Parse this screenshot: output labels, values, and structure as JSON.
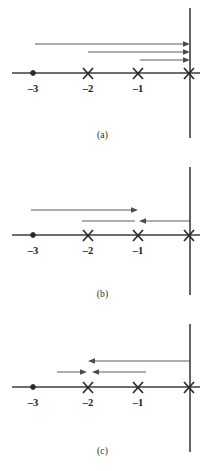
{
  "figure": {
    "title": "",
    "type": "root-locus-real-axis-diagrams",
    "panel_count": 3
  },
  "colors": {
    "axis": "#3d3d3d",
    "locus": "#4a4a4a",
    "text": "#1a1a1a",
    "caption": "#2b2b2b",
    "background": "#ffffff"
  },
  "ticks": {
    "minus_three": "–3",
    "minus_two": "–2",
    "minus_one": "–1"
  },
  "panels": [
    {
      "id": "a",
      "caption": "(a)",
      "marks": [
        {
          "type": "zero",
          "label": "–3",
          "x": -3
        },
        {
          "type": "pole",
          "label": "–2",
          "x": -2
        },
        {
          "type": "pole",
          "label": "–1",
          "x": -1
        },
        {
          "type": "pole",
          "label": "",
          "x": 0
        }
      ],
      "branches": [
        {
          "name": "branch-1",
          "from": -3,
          "to": 0,
          "direction": "right",
          "level": 1
        },
        {
          "name": "branch-2",
          "from": -2,
          "to": 0,
          "direction": "right",
          "level": 2
        },
        {
          "name": "branch-3",
          "from": -1,
          "to": 0,
          "direction": "right",
          "level": 3
        }
      ]
    },
    {
      "id": "b",
      "caption": "(b)",
      "marks": [
        {
          "type": "zero",
          "label": "–3",
          "x": -3
        },
        {
          "type": "pole",
          "label": "–2",
          "x": -2
        },
        {
          "type": "pole",
          "label": "–1",
          "x": -1
        },
        {
          "type": "pole",
          "label": "",
          "x": 0
        }
      ],
      "branches": [
        {
          "name": "branch-1",
          "from": -3,
          "to": -1,
          "direction": "right",
          "level": 1
        },
        {
          "name": "branch-2",
          "from": 0,
          "to": -1,
          "direction": "left",
          "level": 2
        }
      ]
    },
    {
      "id": "c",
      "caption": "(c)",
      "marks": [
        {
          "type": "zero",
          "label": "–3",
          "x": -3
        },
        {
          "type": "pole",
          "label": "–2",
          "x": -2
        },
        {
          "type": "pole",
          "label": "–1",
          "x": -1
        },
        {
          "type": "pole",
          "label": "",
          "x": 0
        }
      ],
      "branches": [
        {
          "name": "branch-1",
          "from": 0,
          "to": -2,
          "direction": "left",
          "level": 1
        },
        {
          "name": "branch-2",
          "from": -3,
          "to": -2,
          "direction": "right",
          "level": 2
        },
        {
          "name": "branch-3",
          "from": -1,
          "to": -2,
          "direction": "left",
          "level": 2
        }
      ]
    }
  ]
}
